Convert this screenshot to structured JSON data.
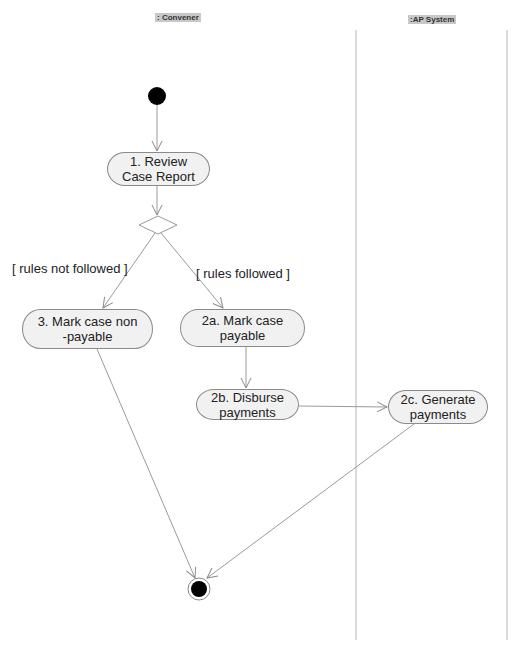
{
  "diagram": {
    "type": "UML activity diagram",
    "swimlanes": [
      {
        "id": "convener",
        "label": ": Convener"
      },
      {
        "id": "ap_system",
        "label": ":AP System"
      }
    ],
    "nodes": [
      {
        "id": "start",
        "kind": "initial"
      },
      {
        "id": "n1",
        "kind": "action",
        "label": "1. Review\nCase Report",
        "lane": "convener"
      },
      {
        "id": "d1",
        "kind": "decision"
      },
      {
        "id": "n3",
        "kind": "action",
        "label": "3. Mark case non\n-payable",
        "lane": "convener"
      },
      {
        "id": "n2a",
        "kind": "action",
        "label": "2a. Mark case\npayable",
        "lane": "convener"
      },
      {
        "id": "n2b",
        "kind": "action",
        "label": "2b. Disburse\npayments",
        "lane": "convener"
      },
      {
        "id": "n2c",
        "kind": "action",
        "label": "2c. Generate\npayments",
        "lane": "ap_system"
      },
      {
        "id": "end",
        "kind": "final"
      }
    ],
    "guards": {
      "not_followed": "[ rules not followed ]",
      "followed": "[ rules followed ]"
    },
    "edges": [
      {
        "from": "start",
        "to": "n1"
      },
      {
        "from": "n1",
        "to": "d1"
      },
      {
        "from": "d1",
        "to": "n3",
        "guard": "[ rules not followed ]"
      },
      {
        "from": "d1",
        "to": "n2a",
        "guard": "[ rules followed ]"
      },
      {
        "from": "n2a",
        "to": "n2b"
      },
      {
        "from": "n2b",
        "to": "n2c"
      },
      {
        "from": "n3",
        "to": "end"
      },
      {
        "from": "n2c",
        "to": "end"
      }
    ],
    "colors": {
      "line": "#9a9a9a",
      "node_fill": "#f1f1f1",
      "node_border": "#8a8a8a",
      "label_bg": "#c8c8c8",
      "terminal": "#000000"
    }
  }
}
